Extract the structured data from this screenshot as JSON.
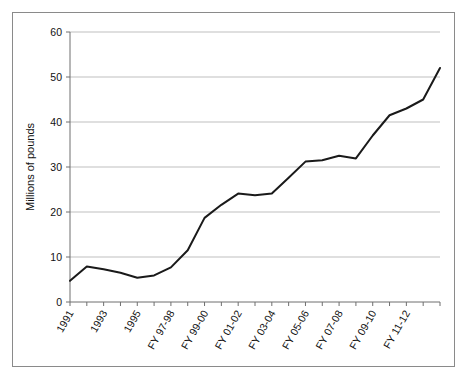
{
  "chart_data": {
    "type": "line",
    "title": "",
    "xlabel": "",
    "ylabel": "Millions of pounds",
    "ylim": [
      0,
      60
    ],
    "ytick_labels": [
      "0",
      "10",
      "20",
      "30",
      "40",
      "50",
      "60"
    ],
    "ytick_values": [
      0,
      10,
      20,
      30,
      40,
      50,
      60
    ],
    "grid": "horizontal",
    "legend": "none",
    "categories": [
      "1991",
      "1992",
      "1993",
      "1994",
      "1995",
      "FY 96-97",
      "FY 97-98",
      "FY 98-99",
      "FY 99-00",
      "FY 00-01",
      "FY 01-02",
      "FY 02-03",
      "FY 03-04",
      "FY 04-05",
      "FY 05-06",
      "FY 06-07",
      "FY 07-08",
      "FY 08-09",
      "FY 09-10",
      "FY 10-11",
      "FY 11-12",
      "FY 12-13",
      "FY 13-14"
    ],
    "xtick_labels_shown": [
      "1991",
      "1993",
      "1995",
      "FY 97-98",
      "FY 99-00",
      "FY 01-02",
      "FY 03-04",
      "FY 05-06",
      "FY 07-08",
      "FY 09-10",
      "FY 11-12"
    ],
    "values": [
      4.7,
      7.9,
      7.3,
      6.5,
      5.4,
      5.9,
      7.7,
      11.5,
      18.7,
      21.6,
      24.1,
      23.7,
      24.1,
      27.6,
      31.2,
      31.5,
      32.5,
      31.9,
      37.0,
      41.5,
      43.0,
      45.0,
      52.0
    ],
    "line_color": "#1a1a1a",
    "line_width": 2,
    "grid_color": "#bfbfbf",
    "axis_color": "#6f6f6f",
    "background_color": "#ffffff"
  }
}
